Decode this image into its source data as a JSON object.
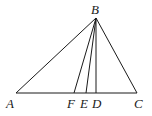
{
  "diagram": {
    "type": "triangle-with-cevians",
    "points": {
      "A": {
        "label": "A",
        "x": 16,
        "y": 93,
        "label_x": 6,
        "label_y": 108
      },
      "B": {
        "label": "B",
        "x": 96,
        "y": 18,
        "label_x": 91,
        "label_y": 14
      },
      "C": {
        "label": "C",
        "x": 137,
        "y": 93,
        "label_x": 134,
        "label_y": 108
      },
      "D": {
        "label": "D",
        "x": 96,
        "y": 93,
        "label_x": 92,
        "label_y": 108
      },
      "E": {
        "label": "E",
        "x": 86,
        "y": 93,
        "label_x": 80,
        "label_y": 108
      },
      "F": {
        "label": "F",
        "x": 74,
        "y": 93,
        "label_x": 67,
        "label_y": 108
      }
    },
    "segments": [
      "AB",
      "BC",
      "AC",
      "BF",
      "BE",
      "BD"
    ],
    "stroke_color": "#1a1a1a"
  }
}
